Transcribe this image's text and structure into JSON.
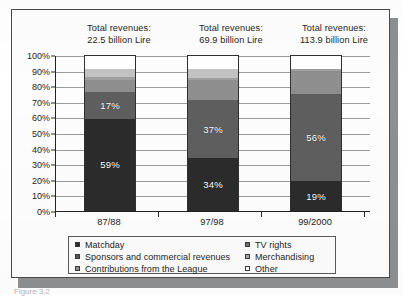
{
  "chart_data": {
    "type": "bar",
    "subtype": "stacked-100-percent",
    "title": "",
    "xlabel": "",
    "ylabel": "",
    "ylim": [
      0,
      100
    ],
    "yticks": [
      "0%",
      "10%",
      "20%",
      "30%",
      "40%",
      "50%",
      "60%",
      "70%",
      "80%",
      "90%",
      "100%"
    ],
    "grid": true,
    "legend_position": "bottom",
    "categories": [
      "87/88",
      "97/98",
      "99/2000"
    ],
    "annotations": [
      "Total revenues: 22.5 billion Lire",
      "Total revenues: 69.9 billion Lire",
      "Total revenues: 113.9 billion Lire"
    ],
    "series": [
      {
        "name": "Matchday",
        "color": "#2b2b2b",
        "values": [
          59,
          34,
          19
        ],
        "labels": [
          "59%",
          "34%",
          "19%"
        ]
      },
      {
        "name": "TV rights",
        "color": "#5e5e5e",
        "values": [
          17,
          37,
          56
        ],
        "labels": [
          "17%",
          "37%",
          "56%"
        ]
      },
      {
        "name": "Sponsors and commercial revenues",
        "color": "#8e8e8e",
        "values": [
          8,
          13,
          15
        ],
        "labels": [
          "",
          "",
          ""
        ]
      },
      {
        "name": "Merchandising",
        "color": "#9f9f9f",
        "values": [
          2,
          1,
          1
        ],
        "labels": [
          "",
          "",
          ""
        ]
      },
      {
        "name": "Contributions from the League",
        "color": "#c2c2c2",
        "values": [
          5,
          6,
          0
        ],
        "labels": [
          "",
          "",
          ""
        ]
      },
      {
        "name": "Other",
        "color": "#ffffff",
        "values": [
          9,
          9,
          9
        ],
        "labels": [
          "",
          "",
          ""
        ]
      }
    ]
  },
  "totals": [
    {
      "line1": "Total revenues:",
      "line2": "22.5 billion Lire"
    },
    {
      "line1": "Total revenues:",
      "line2": "69.9 billion Lire"
    },
    {
      "line1": "Total revenues:",
      "line2": "113.9 billion Lire"
    }
  ],
  "legend": {
    "left_column": [
      {
        "label": "Matchday",
        "color": "#2b2b2b"
      },
      {
        "label": "Sponsors and commercial revenues",
        "color": "#585858"
      },
      {
        "label": "Contributions from the League",
        "color": "#8e8e8e"
      }
    ],
    "right_column": [
      {
        "label": "TV rights",
        "color": "#6e6e6e"
      },
      {
        "label": "Merchandising",
        "color": "#a8a8a8"
      },
      {
        "label": "Other",
        "color": "#ffffff"
      }
    ]
  },
  "caption": "Figure 3.2",
  "colors": {
    "axis": "#222222",
    "grid": "#9a9a9a",
    "paper": "#fdfdfd",
    "shadow": "#8d8f91",
    "text": "#1d1d1d",
    "data_label": "#ffffff"
  }
}
